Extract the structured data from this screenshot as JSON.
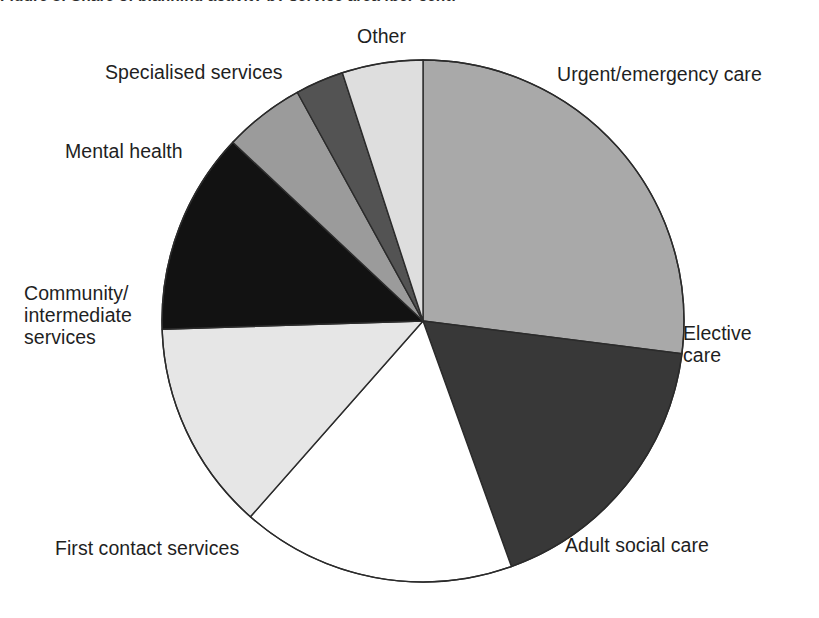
{
  "figure": {
    "caption_clipped": "Figure 3: Share of planning activity by service area (per cent)"
  },
  "chart_data": {
    "type": "pie",
    "title": "",
    "subtitle": "",
    "xlabel": "",
    "ylabel": "",
    "grid": false,
    "legend_position": "none",
    "label_placement": "outside-callout",
    "start_angle_deg_from_12oclock": 0,
    "direction": "clockwise",
    "total": 100,
    "units": "per cent",
    "categories": [
      "Urgent/emergency care",
      "Elective care",
      "Adult social care",
      "First contact services",
      "Community/ intermediate services",
      "Mental health",
      "Specialised services",
      "Other"
    ],
    "values": [
      27,
      17.5,
      17,
      13,
      12.5,
      5,
      3,
      5
    ],
    "slices": [
      {
        "label": "Urgent/emergency care",
        "value": 27,
        "color": "#a9a9a9",
        "start_deg": 0,
        "end_deg": 97.2,
        "label_lines": [
          "Urgent/emergency care"
        ]
      },
      {
        "label": "Elective care",
        "value": 17.5,
        "color": "#383838",
        "start_deg": 97.2,
        "end_deg": 160.2,
        "label_lines": [
          "Elective",
          "care"
        ]
      },
      {
        "label": "Adult social care",
        "value": 17,
        "color": "#ffffff",
        "start_deg": 160.2,
        "end_deg": 221.4,
        "label_lines": [
          "Adult social care"
        ]
      },
      {
        "label": "First contact services",
        "value": 13,
        "color": "#e6e6e6",
        "start_deg": 221.4,
        "end_deg": 268.2,
        "label_lines": [
          "First contact services"
        ]
      },
      {
        "label": "Community/ intermediate services",
        "value": 12.5,
        "color": "#121212",
        "start_deg": 268.2,
        "end_deg": 313.2,
        "label_lines": [
          "Community/",
          "intermediate",
          "services"
        ]
      },
      {
        "label": "Mental health",
        "value": 5,
        "color": "#9b9b9b",
        "start_deg": 313.2,
        "end_deg": 331.2,
        "label_lines": [
          "Mental health"
        ]
      },
      {
        "label": "Specialised services",
        "value": 3,
        "color": "#535353",
        "start_deg": 331.2,
        "end_deg": 342.0,
        "label_lines": [
          "Specialised services"
        ]
      },
      {
        "label": "Other",
        "value": 5,
        "color": "#dedede",
        "start_deg": 342.0,
        "end_deg": 360.0,
        "label_lines": [
          "Other"
        ]
      }
    ],
    "geometry": {
      "center_x": 423,
      "center_y": 321,
      "radius": 261,
      "outline_color": "#2b2b2b",
      "outline_width": 1.4
    }
  },
  "labels": {
    "other": "Other",
    "urgent_emergency_care": "Urgent/emergency care",
    "elective_care": "Elective\ncare",
    "adult_social_care": "Adult social care",
    "first_contact_services": "First contact services",
    "community_intermediate_services": "Community/\nintermediate\nservices",
    "mental_health": "Mental health",
    "specialised_services": "Specialised services"
  }
}
